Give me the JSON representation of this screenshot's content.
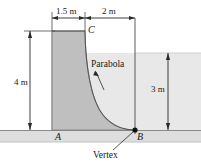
{
  "figure": {
    "dimensions": {
      "top_left_width": "1.5 m",
      "top_right_width": "2 m",
      "left_height": "4 m",
      "right_height": "3 m"
    },
    "points": {
      "a": "A",
      "b": "B",
      "c": "C"
    },
    "annotations": {
      "curve": "Parabola",
      "vertex": "Vertex"
    },
    "colors": {
      "body_fill": "#bfbfbf",
      "water_fill": "#e8e8e8",
      "ground_fill": "#dedede",
      "line": "#1a1a1a",
      "background": "#ffffff"
    },
    "geometry": {
      "ground_y": 130,
      "ground_bottom_y": 142,
      "dam_left_x": 52,
      "dam_crest_x": 85,
      "dam_top_y": 31,
      "vertex_x": 135,
      "water_surface_y": 53,
      "right_edge_x": 201,
      "left_dim_x": 30,
      "right_dim_x": 168,
      "top_dim_y": 18
    }
  }
}
